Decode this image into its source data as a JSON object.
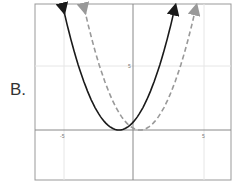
{
  "question_label": "B.",
  "chart_data": {
    "type": "line",
    "title": "",
    "xlabel": "",
    "ylabel": "",
    "xlim": [
      -9.5,
      7
    ],
    "ylim": [
      -3.9,
      6.9
    ],
    "grid": true,
    "x_ticks": [
      {
        "value": -5,
        "label": "-5"
      },
      {
        "value": 5,
        "label": "5"
      }
    ],
    "y_ticks": [
      {
        "value": 5,
        "label": "5"
      }
    ],
    "series": [
      {
        "name": "solid parabola",
        "style": "solid",
        "color": "#1a1a1a",
        "vertex": [
          -1,
          0
        ],
        "a": 0.6,
        "arrows": "both-ends-up"
      },
      {
        "name": "dashed parabola",
        "style": "dashed",
        "color": "#999999",
        "vertex": [
          0.5,
          0
        ],
        "a": 0.6,
        "arrows": "both-ends-up"
      }
    ]
  }
}
